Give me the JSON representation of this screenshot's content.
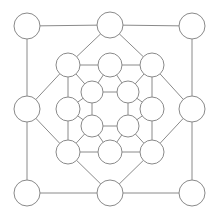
{
  "diagram": {
    "canvas": {
      "width": 220,
      "height": 218,
      "background": "#ffffff"
    },
    "style": {
      "edge_color": "#8a8a8a",
      "edge_width": 1,
      "node_stroke": "#8a8a8a",
      "node_fill": "#ffffff",
      "node_stroke_width": 1
    },
    "rings": [
      {
        "id": "outer",
        "label": "Outer Ring",
        "node_count": 8,
        "radius": 13
      },
      {
        "id": "middle",
        "label": "Middle Ring",
        "node_count": 8,
        "radius": 12
      },
      {
        "id": "inner",
        "label": "Inner Ring",
        "node_count": 4,
        "radius": 11
      }
    ],
    "nodes": [
      {
        "id": "o-nw",
        "ring": "outer",
        "label": "",
        "cx": 27,
        "cy": 26,
        "r": 13
      },
      {
        "id": "o-n",
        "ring": "outer",
        "label": "",
        "cx": 110,
        "cy": 25,
        "r": 13
      },
      {
        "id": "o-ne",
        "ring": "outer",
        "label": "",
        "cx": 192,
        "cy": 26,
        "r": 13
      },
      {
        "id": "o-e",
        "ring": "outer",
        "label": "",
        "cx": 192,
        "cy": 109,
        "r": 13
      },
      {
        "id": "o-se",
        "ring": "outer",
        "label": "",
        "cx": 192,
        "cy": 193,
        "r": 13
      },
      {
        "id": "o-s",
        "ring": "outer",
        "label": "",
        "cx": 110,
        "cy": 193,
        "r": 13
      },
      {
        "id": "o-sw",
        "ring": "outer",
        "label": "",
        "cx": 27,
        "cy": 193,
        "r": 13
      },
      {
        "id": "o-w",
        "ring": "outer",
        "label": "",
        "cx": 27,
        "cy": 109,
        "r": 13
      },
      {
        "id": "m-nw",
        "ring": "middle",
        "label": "",
        "cx": 68,
        "cy": 65,
        "r": 12
      },
      {
        "id": "m-n",
        "ring": "middle",
        "label": "",
        "cx": 110,
        "cy": 65,
        "r": 12
      },
      {
        "id": "m-ne",
        "ring": "middle",
        "label": "",
        "cx": 152,
        "cy": 65,
        "r": 12
      },
      {
        "id": "m-e",
        "ring": "middle",
        "label": "",
        "cx": 152,
        "cy": 109,
        "r": 12
      },
      {
        "id": "m-se",
        "ring": "middle",
        "label": "",
        "cx": 152,
        "cy": 152,
        "r": 12
      },
      {
        "id": "m-s",
        "ring": "middle",
        "label": "",
        "cx": 110,
        "cy": 152,
        "r": 12
      },
      {
        "id": "m-sw",
        "ring": "middle",
        "label": "",
        "cx": 68,
        "cy": 152,
        "r": 12
      },
      {
        "id": "m-w",
        "ring": "middle",
        "label": "",
        "cx": 68,
        "cy": 109,
        "r": 12
      },
      {
        "id": "i-nw",
        "ring": "inner",
        "label": "",
        "cx": 92,
        "cy": 92,
        "r": 11
      },
      {
        "id": "i-ne",
        "ring": "inner",
        "label": "",
        "cx": 128,
        "cy": 92,
        "r": 11
      },
      {
        "id": "i-se",
        "ring": "inner",
        "label": "",
        "cx": 128,
        "cy": 126,
        "r": 11
      },
      {
        "id": "i-sw",
        "ring": "inner",
        "label": "",
        "cx": 92,
        "cy": 126,
        "r": 11
      }
    ],
    "edges": [
      {
        "from": "o-nw",
        "to": "o-n",
        "kind": "outer-perimeter"
      },
      {
        "from": "o-n",
        "to": "o-ne",
        "kind": "outer-perimeter"
      },
      {
        "from": "o-ne",
        "to": "o-e",
        "kind": "outer-perimeter"
      },
      {
        "from": "o-e",
        "to": "o-se",
        "kind": "outer-perimeter"
      },
      {
        "from": "o-se",
        "to": "o-s",
        "kind": "outer-perimeter"
      },
      {
        "from": "o-s",
        "to": "o-sw",
        "kind": "outer-perimeter"
      },
      {
        "from": "o-sw",
        "to": "o-w",
        "kind": "outer-perimeter"
      },
      {
        "from": "o-w",
        "to": "o-nw",
        "kind": "outer-perimeter"
      },
      {
        "from": "o-n",
        "to": "m-nw",
        "kind": "outer-to-middle-diagonal"
      },
      {
        "from": "o-n",
        "to": "m-ne",
        "kind": "outer-to-middle-diagonal"
      },
      {
        "from": "o-e",
        "to": "m-ne",
        "kind": "outer-to-middle-diagonal"
      },
      {
        "from": "o-e",
        "to": "m-se",
        "kind": "outer-to-middle-diagonal"
      },
      {
        "from": "o-s",
        "to": "m-se",
        "kind": "outer-to-middle-diagonal"
      },
      {
        "from": "o-s",
        "to": "m-sw",
        "kind": "outer-to-middle-diagonal"
      },
      {
        "from": "o-w",
        "to": "m-sw",
        "kind": "outer-to-middle-diagonal"
      },
      {
        "from": "o-w",
        "to": "m-nw",
        "kind": "outer-to-middle-diagonal"
      },
      {
        "from": "m-nw",
        "to": "m-n",
        "kind": "middle-perimeter"
      },
      {
        "from": "m-n",
        "to": "m-ne",
        "kind": "middle-perimeter"
      },
      {
        "from": "m-ne",
        "to": "m-e",
        "kind": "middle-perimeter"
      },
      {
        "from": "m-e",
        "to": "m-se",
        "kind": "middle-perimeter"
      },
      {
        "from": "m-se",
        "to": "m-s",
        "kind": "middle-perimeter"
      },
      {
        "from": "m-s",
        "to": "m-sw",
        "kind": "middle-perimeter"
      },
      {
        "from": "m-sw",
        "to": "m-w",
        "kind": "middle-perimeter"
      },
      {
        "from": "m-w",
        "to": "m-nw",
        "kind": "middle-perimeter"
      },
      {
        "from": "m-nw",
        "to": "i-nw",
        "kind": "middle-to-inner-diagonal"
      },
      {
        "from": "m-ne",
        "to": "i-ne",
        "kind": "middle-to-inner-diagonal"
      },
      {
        "from": "m-se",
        "to": "i-se",
        "kind": "middle-to-inner-diagonal"
      },
      {
        "from": "m-sw",
        "to": "i-sw",
        "kind": "middle-to-inner-diagonal"
      },
      {
        "from": "m-n",
        "to": "i-nw",
        "kind": "middle-to-inner"
      },
      {
        "from": "m-n",
        "to": "i-ne",
        "kind": "middle-to-inner"
      },
      {
        "from": "m-e",
        "to": "i-ne",
        "kind": "middle-to-inner"
      },
      {
        "from": "m-e",
        "to": "i-se",
        "kind": "middle-to-inner"
      },
      {
        "from": "m-s",
        "to": "i-se",
        "kind": "middle-to-inner"
      },
      {
        "from": "m-s",
        "to": "i-sw",
        "kind": "middle-to-inner"
      },
      {
        "from": "m-w",
        "to": "i-sw",
        "kind": "middle-to-inner"
      },
      {
        "from": "m-w",
        "to": "i-nw",
        "kind": "middle-to-inner"
      },
      {
        "from": "i-nw",
        "to": "i-ne",
        "kind": "inner-perimeter"
      },
      {
        "from": "i-ne",
        "to": "i-se",
        "kind": "inner-perimeter"
      },
      {
        "from": "i-se",
        "to": "i-sw",
        "kind": "inner-perimeter"
      },
      {
        "from": "i-sw",
        "to": "i-nw",
        "kind": "inner-perimeter"
      }
    ]
  }
}
